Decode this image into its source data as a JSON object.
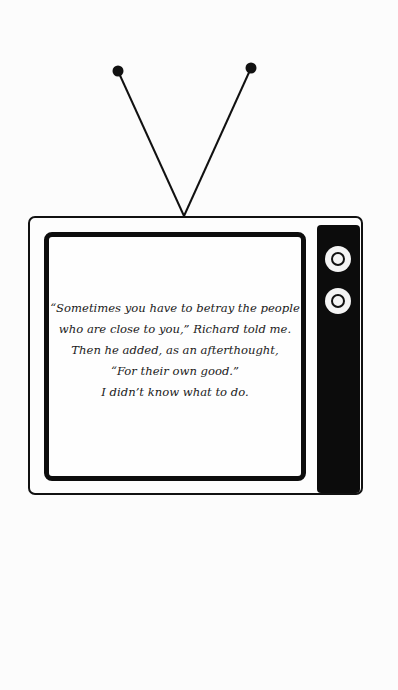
{
  "illustration": {
    "subject": "retro-television",
    "colors": {
      "ink": "#111111",
      "background": "#fcfcfc"
    },
    "antenna": {
      "left_tip": [
        118,
        71
      ],
      "right_tip": [
        251,
        68
      ],
      "base": [
        184,
        216
      ]
    },
    "knobs": 2
  },
  "quote": {
    "lines": [
      "“Sometimes you have to betray the people",
      "who are close to you,” Richard told me.",
      "Then he added, as an afterthought,",
      "“For their own good.”",
      "I didn’t know what to do."
    ]
  }
}
